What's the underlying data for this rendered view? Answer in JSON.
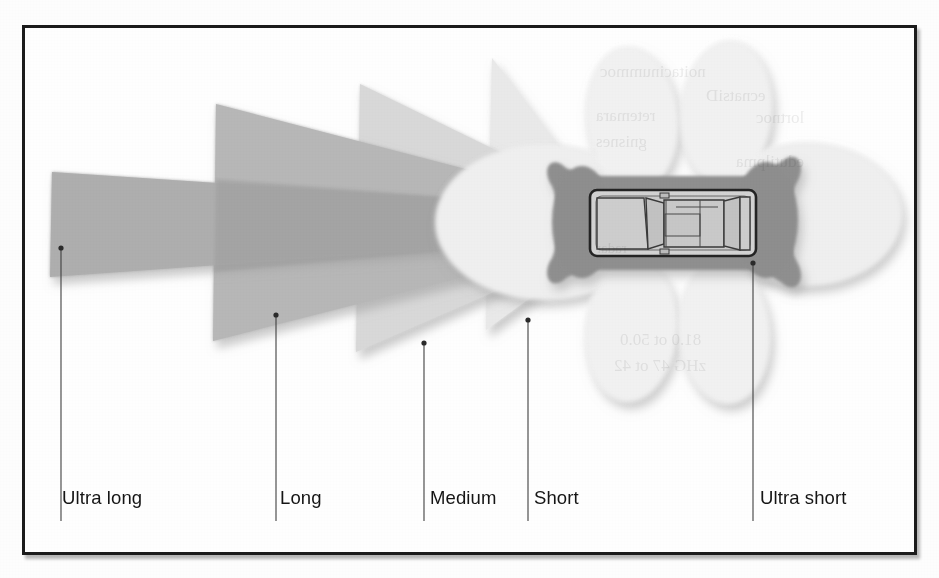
{
  "figure": {
    "border_color": "#1c1c1c",
    "background_color": "#fefefe"
  },
  "labels": [
    {
      "id": "ultra-long",
      "text": "Ultra long",
      "label_x": 62,
      "label_y": 497,
      "line_x": 61,
      "line_top": 248,
      "line_bottom": 521
    },
    {
      "id": "long",
      "text": "Long",
      "label_x": 278,
      "label_y": 497,
      "line_x": 276,
      "line_top": 315,
      "line_bottom": 521
    },
    {
      "id": "medium",
      "text": "Medium",
      "label_x": 430,
      "label_y": 497,
      "line_x": 424,
      "line_top": 343,
      "line_bottom": 521
    },
    {
      "id": "short",
      "text": "Short",
      "label_x": 534,
      "label_y": 497,
      "line_x": 528,
      "line_top": 320,
      "line_bottom": 521
    },
    {
      "id": "ultra-short",
      "text": "Ultra short",
      "label_x": 760,
      "label_y": 497,
      "line_x": 753,
      "line_top": 263,
      "line_bottom": 521
    }
  ],
  "zones": [
    {
      "id": "ultra-long",
      "name": "Ultra long range beam",
      "color": "#b2b2b2",
      "reach_x": 50,
      "half_angle_deg": 4,
      "note": "narrow long-reach forward beam"
    },
    {
      "id": "long",
      "name": "Long range beam",
      "color": "#b8b8b8",
      "reach_x": 214,
      "half_angle_deg": 16,
      "note": "forward cone"
    },
    {
      "id": "medium",
      "name": "Medium range beam",
      "color": "#d6d6d6",
      "reach_x": 358,
      "half_angle_deg": 26,
      "note": "forward cone"
    },
    {
      "id": "short",
      "name": "Short range beam",
      "color": "#e7e7e7",
      "reach_x": 488,
      "half_angle_deg": 36,
      "note": "forward wide cone"
    },
    {
      "id": "ultra-short",
      "name": "Ultra short range zone",
      "color": "#8e8e8e",
      "reach_x": 560,
      "half_angle_deg": 0,
      "note": "dark bow-tie hugging the vehicle"
    },
    {
      "id": "proximity-petals",
      "name": "Ultra short proximity lobes",
      "color": "#f1f1f1",
      "half_angle_deg": 0,
      "note": "four light elliptical lobes around the car"
    }
  ],
  "vehicle": {
    "name": "car-top-view",
    "body_color": "#cfcfcf",
    "outline_color": "#262626",
    "x": 590,
    "y": 190,
    "width": 166,
    "height": 66,
    "heading": "facing left"
  },
  "ghost_text": [
    {
      "t": "noitacinummoc",
      "x": 600,
      "y": 62,
      "size": 17
    },
    {
      "t": "ecnatsiD",
      "x": 706,
      "y": 86,
      "size": 17
    },
    {
      "t": "retemara",
      "x": 596,
      "y": 106,
      "size": 17
    },
    {
      "t": "lortnoc",
      "x": 756,
      "y": 108,
      "size": 17
    },
    {
      "t": "gnisnes",
      "x": 596,
      "y": 132,
      "size": 17
    },
    {
      "t": "edutilpma",
      "x": 736,
      "y": 152,
      "size": 17
    },
    {
      "t": "radar",
      "x": 596,
      "y": 240,
      "size": 15
    },
    {
      "t": "81.0 ot 50.0",
      "x": 620,
      "y": 330,
      "size": 17
    },
    {
      "t": "zHG 47 ot 42",
      "x": 614,
      "y": 356,
      "size": 17
    }
  ],
  "chart_data": {
    "type": "diagram",
    "categories": [
      "Ultra long",
      "Long",
      "Medium",
      "Short",
      "Ultra short"
    ],
    "legend_position": "below",
    "grid": false
  }
}
